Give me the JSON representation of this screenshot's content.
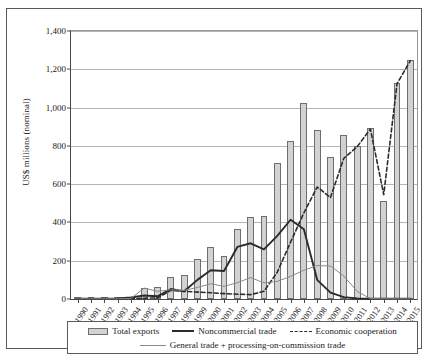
{
  "chart_data": {
    "type": "bar",
    "title": "",
    "xlabel": "",
    "ylabel": "US$ millions (nominal)",
    "ylim": [
      0,
      1400
    ],
    "ytick_labels": [
      "0",
      "200",
      "400",
      "600",
      "800",
      "1,000",
      "1,200",
      "1,400"
    ],
    "yticks": [
      0,
      200,
      400,
      600,
      800,
      1000,
      1200,
      1400
    ],
    "grid": "horizontal",
    "legend_position": "bottom",
    "categories": [
      "1990",
      "1991",
      "1992",
      "1993",
      "1994",
      "1995",
      "1996",
      "1997",
      "1998",
      "1999",
      "2000",
      "2001",
      "2002",
      "2003",
      "2004",
      "2005",
      "2006",
      "2007",
      "2008",
      "2009",
      "2010",
      "2011",
      "2012",
      "2013",
      "2014",
      "2015"
    ],
    "series": [
      {
        "name": "Total exports",
        "kind": "bar",
        "color": "#d2d2d2",
        "values": [
          2,
          3,
          3,
          4,
          12,
          57,
          65,
          113,
          123,
          211,
          270,
          224,
          367,
          429,
          434,
          712,
          825,
          1025,
          884,
          740,
          858,
          800,
          895,
          510,
          1130,
          1250
        ]
      },
      {
        "name": "Noncommercial trade",
        "kind": "line-solid",
        "color": "#2b2b2b",
        "values": [
          1,
          2,
          2,
          3,
          8,
          18,
          14,
          52,
          40,
          100,
          150,
          146,
          272,
          291,
          259,
          330,
          414,
          364,
          100,
          33,
          10,
          3,
          2,
          2,
          2,
          2
        ]
      },
      {
        "name": "Economic cooperation",
        "kind": "line-dashed",
        "color": "#2b2b2b",
        "values": [
          1,
          1,
          1,
          1,
          2,
          4,
          6,
          45,
          40,
          36,
          33,
          28,
          25,
          23,
          40,
          140,
          297,
          450,
          585,
          530,
          735,
          795,
          888,
          545,
          1125,
          1245
        ]
      },
      {
        "name": "General trade + processing-on-commission trade",
        "kind": "line-thin",
        "color": "#8a8a8a",
        "values": [
          1,
          1,
          1,
          1,
          3,
          57,
          40,
          48,
          45,
          60,
          80,
          66,
          85,
          112,
          84,
          92,
          118,
          150,
          175,
          172,
          120,
          40,
          2,
          1,
          1,
          1
        ]
      }
    ],
    "legend": [
      {
        "label": "Total exports",
        "marker": "bar-swatch"
      },
      {
        "label": "Noncommercial trade",
        "marker": "solid-line"
      },
      {
        "label": "Economic cooperation",
        "marker": "dashed-line"
      },
      {
        "label": "General trade + processing-on-commission trade",
        "marker": "thin-line"
      }
    ]
  }
}
